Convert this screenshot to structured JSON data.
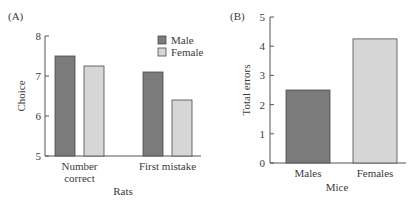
{
  "chart_data": [
    {
      "panel_label": "(A)",
      "type": "bar",
      "xlabel": "Rats",
      "ylabel": "Choice",
      "ylim": [
        5,
        8
      ],
      "yticks": [
        5,
        6,
        7,
        8
      ],
      "categories": [
        "Number correct",
        "First mistake"
      ],
      "category_lines": [
        [
          "Number",
          "correct"
        ],
        [
          "First mistake"
        ]
      ],
      "series": [
        {
          "name": "Male",
          "color": "#7b7b7b",
          "values": [
            7.5,
            7.1
          ]
        },
        {
          "name": "Female",
          "color": "#d6d6d6",
          "values": [
            7.25,
            6.4
          ]
        }
      ],
      "legend": {
        "position": "upper right",
        "entries": [
          "Male",
          "Female"
        ]
      },
      "grid": false
    },
    {
      "panel_label": "(B)",
      "type": "bar",
      "xlabel": "Mice",
      "ylabel": "Total errors",
      "ylim": [
        0,
        5
      ],
      "yticks": [
        0,
        1,
        2,
        3,
        4,
        5
      ],
      "categories": [
        "Males",
        "Females"
      ],
      "values": [
        2.5,
        4.25
      ],
      "colors": [
        "#7b7b7b",
        "#d6d6d6"
      ],
      "grid": false
    }
  ]
}
